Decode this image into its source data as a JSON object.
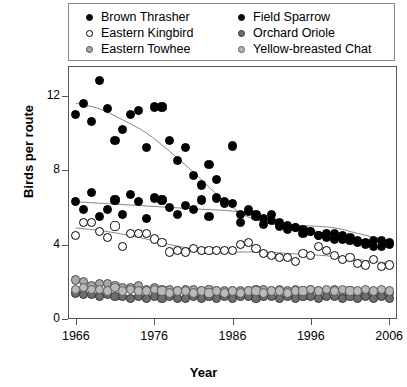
{
  "chart_data": {
    "type": "scatter",
    "title": "",
    "xlabel": "Year",
    "ylabel": "Birds per route",
    "xlim": [
      1965,
      2007
    ],
    "ylim": [
      0,
      13.6
    ],
    "xticks": [
      1966,
      1976,
      1986,
      1996,
      2006
    ],
    "yticks": [
      0,
      4,
      8,
      12
    ],
    "grid": false,
    "legend_position": "top",
    "smoothers": true,
    "series": [
      {
        "name": "Brown Thrasher",
        "marker": "filled-circle",
        "color": "#000000",
        "fill": "#000000",
        "x": [
          1966,
          1967,
          1968,
          1969,
          1970,
          1971,
          1972,
          1973,
          1974,
          1975,
          1976,
          1977,
          1978,
          1979,
          1980,
          1981,
          1982,
          1983,
          1984,
          1985,
          1986,
          1987,
          1988,
          1989,
          1990,
          1991,
          1992,
          1993,
          1994,
          1995,
          1996,
          1997,
          1998,
          1999,
          2000,
          2001,
          2002,
          2003,
          2004,
          2005,
          2006
        ],
        "y": [
          11.0,
          11.6,
          10.6,
          12.8,
          11.3,
          9.6,
          10.2,
          11.0,
          11.2,
          9.2,
          11.4,
          11.4,
          9.6,
          8.5,
          9.2,
          7.7,
          7.2,
          8.3,
          7.5,
          6.2,
          9.3,
          5.6,
          5.8,
          5.5,
          5.1,
          5.3,
          5.0,
          4.8,
          4.9,
          4.6,
          4.7,
          4.5,
          4.6,
          4.3,
          4.5,
          4.4,
          4.2,
          4.1,
          3.9,
          4.2,
          4.1
        ]
      },
      {
        "name": "Field Sparrow",
        "marker": "filled-circle",
        "color": "#000000",
        "fill": "#000000",
        "x": [
          1966,
          1967,
          1968,
          1969,
          1970,
          1971,
          1972,
          1973,
          1974,
          1975,
          1976,
          1977,
          1978,
          1979,
          1980,
          1981,
          1982,
          1983,
          1984,
          1985,
          1986,
          1987,
          1988,
          1989,
          1990,
          1991,
          1992,
          1993,
          1994,
          1995,
          1996,
          1997,
          1998,
          1999,
          2000,
          2001,
          2002,
          2003,
          2004,
          2005,
          2006
        ],
        "y": [
          6.3,
          5.9,
          6.8,
          5.5,
          5.9,
          6.4,
          5.6,
          6.7,
          6.3,
          5.4,
          6.5,
          6.4,
          6.0,
          5.6,
          6.1,
          5.9,
          6.4,
          5.5,
          6.5,
          6.3,
          6.2,
          5.2,
          5.9,
          5.6,
          5.4,
          5.6,
          5.2,
          5.0,
          4.9,
          4.8,
          4.7,
          4.5,
          4.4,
          4.6,
          4.3,
          4.2,
          4.1,
          4.0,
          4.2,
          3.9,
          4.0
        ]
      },
      {
        "name": "Eastern Kingbird",
        "marker": "open-circle",
        "color": "#000000",
        "fill": "#ffffff",
        "x": [
          1966,
          1967,
          1968,
          1969,
          1970,
          1971,
          1972,
          1973,
          1974,
          1975,
          1976,
          1977,
          1978,
          1979,
          1980,
          1981,
          1982,
          1983,
          1984,
          1985,
          1986,
          1987,
          1988,
          1989,
          1990,
          1991,
          1992,
          1993,
          1994,
          1995,
          1996,
          1997,
          1998,
          1999,
          2000,
          2001,
          2002,
          2003,
          2004,
          2005,
          2006
        ],
        "y": [
          4.5,
          5.2,
          5.2,
          4.7,
          4.4,
          5.0,
          3.9,
          4.6,
          4.6,
          4.6,
          4.3,
          4.1,
          3.6,
          3.7,
          3.6,
          3.8,
          3.7,
          3.7,
          3.7,
          3.7,
          3.7,
          4.0,
          4.1,
          3.8,
          3.5,
          3.4,
          3.3,
          3.3,
          3.1,
          3.5,
          3.4,
          3.9,
          3.7,
          3.4,
          3.2,
          3.3,
          3.0,
          2.9,
          3.2,
          2.8,
          2.9
        ]
      },
      {
        "name": "Eastern Towhee",
        "marker": "filled-circle-light",
        "color": "#4d4d4d",
        "fill": "#a8a8a8",
        "x": [
          1966,
          1967,
          1968,
          1969,
          1970,
          1971,
          1972,
          1973,
          1974,
          1975,
          1976,
          1977,
          1978,
          1979,
          1980,
          1981,
          1982,
          1983,
          1984,
          1985,
          1986,
          1987,
          1988,
          1989,
          1990,
          1991,
          1992,
          1993,
          1994,
          1995,
          1996,
          1997,
          1998,
          1999,
          2000,
          2001,
          2002,
          2003,
          2004,
          2005,
          2006
        ],
        "y": [
          2.1,
          2.0,
          1.8,
          1.9,
          1.9,
          1.8,
          1.7,
          1.7,
          1.8,
          1.6,
          1.7,
          1.6,
          1.6,
          1.5,
          1.6,
          1.6,
          1.5,
          1.6,
          1.5,
          1.5,
          1.5,
          1.5,
          1.5,
          1.6,
          1.6,
          1.5,
          1.6,
          1.5,
          1.6,
          1.5,
          1.6,
          1.5,
          1.5,
          1.6,
          1.5,
          1.5,
          1.4,
          1.5,
          1.4,
          1.5,
          1.4
        ]
      },
      {
        "name": "Orchard Oriole",
        "marker": "filled-circle-dark",
        "color": "#333333",
        "fill": "#6e6e6e",
        "x": [
          1966,
          1967,
          1968,
          1969,
          1970,
          1971,
          1972,
          1973,
          1974,
          1975,
          1976,
          1977,
          1978,
          1979,
          1980,
          1981,
          1982,
          1983,
          1984,
          1985,
          1986,
          1987,
          1988,
          1989,
          1990,
          1991,
          1992,
          1993,
          1994,
          1995,
          1996,
          1997,
          1998,
          1999,
          2000,
          2001,
          2002,
          2003,
          2004,
          2005,
          2006
        ],
        "y": [
          1.4,
          1.3,
          1.3,
          1.2,
          1.3,
          1.2,
          1.2,
          1.1,
          1.2,
          1.1,
          1.2,
          1.1,
          1.2,
          1.1,
          1.1,
          1.2,
          1.1,
          1.2,
          1.1,
          1.2,
          1.1,
          1.2,
          1.2,
          1.1,
          1.2,
          1.2,
          1.1,
          1.2,
          1.1,
          1.2,
          1.2,
          1.1,
          1.2,
          1.2,
          1.1,
          1.2,
          1.1,
          1.2,
          1.1,
          1.2,
          1.1
        ]
      },
      {
        "name": "Yellow-breasted Chat",
        "marker": "filled-circle-lighter",
        "color": "#5a5a5a",
        "fill": "#b9b9b9",
        "x": [
          1966,
          1967,
          1968,
          1969,
          1970,
          1971,
          1972,
          1973,
          1974,
          1975,
          1976,
          1977,
          1978,
          1979,
          1980,
          1981,
          1982,
          1983,
          1984,
          1985,
          1986,
          1987,
          1988,
          1989,
          1990,
          1991,
          1992,
          1993,
          1994,
          1995,
          1996,
          1997,
          1998,
          1999,
          2000,
          2001,
          2002,
          2003,
          2004,
          2005,
          2006
        ],
        "y": [
          1.6,
          1.7,
          1.6,
          1.6,
          1.5,
          1.7,
          1.5,
          1.6,
          1.5,
          1.5,
          1.6,
          1.5,
          1.4,
          1.5,
          1.5,
          1.4,
          1.5,
          1.4,
          1.5,
          1.4,
          1.5,
          1.4,
          1.5,
          1.5,
          1.4,
          1.5,
          1.5,
          1.4,
          1.5,
          1.5,
          1.6,
          1.5,
          1.6,
          1.5,
          1.6,
          1.5,
          1.5,
          1.6,
          1.5,
          1.6,
          1.5
        ]
      }
    ],
    "trend_lines": [
      {
        "series": "Brown Thrasher",
        "points": [
          [
            1966,
            11.6
          ],
          [
            1969,
            11.3
          ],
          [
            1972,
            10.7
          ],
          [
            1975,
            10.0
          ],
          [
            1978,
            9.0
          ],
          [
            1981,
            7.9
          ],
          [
            1984,
            6.7
          ],
          [
            1987,
            5.7
          ],
          [
            1990,
            5.2
          ],
          [
            1993,
            5.0
          ],
          [
            1996,
            5.0
          ],
          [
            1999,
            4.9
          ],
          [
            2002,
            4.6
          ],
          [
            2006,
            4.2
          ]
        ]
      },
      {
        "series": "Field Sparrow",
        "points": [
          [
            1966,
            6.3
          ],
          [
            1970,
            6.2
          ],
          [
            1974,
            6.1
          ],
          [
            1978,
            6.0
          ],
          [
            1982,
            5.9
          ],
          [
            1986,
            5.8
          ],
          [
            1990,
            5.5
          ],
          [
            1994,
            5.0
          ],
          [
            1998,
            4.6
          ],
          [
            2002,
            4.3
          ],
          [
            2006,
            4.0
          ]
        ]
      },
      {
        "series": "Eastern Kingbird",
        "points": [
          [
            1966,
            4.9
          ],
          [
            1970,
            4.7
          ],
          [
            1974,
            4.4
          ],
          [
            1978,
            4.0
          ],
          [
            1982,
            3.7
          ],
          [
            1986,
            3.6
          ],
          [
            1990,
            3.6
          ],
          [
            1994,
            3.5
          ],
          [
            1998,
            3.4
          ],
          [
            2002,
            3.2
          ],
          [
            2006,
            3.0
          ]
        ]
      },
      {
        "series": "Eastern Towhee",
        "points": [
          [
            1966,
            2.0
          ],
          [
            1972,
            1.75
          ],
          [
            1978,
            1.6
          ],
          [
            1984,
            1.55
          ],
          [
            1990,
            1.55
          ],
          [
            1996,
            1.55
          ],
          [
            2002,
            1.5
          ],
          [
            2006,
            1.45
          ]
        ]
      },
      {
        "series": "Orchard Oriole",
        "points": [
          [
            1966,
            1.3
          ],
          [
            1974,
            1.2
          ],
          [
            1984,
            1.15
          ],
          [
            1994,
            1.15
          ],
          [
            2006,
            1.15
          ]
        ]
      },
      {
        "series": "Yellow-breasted Chat",
        "points": [
          [
            1966,
            1.6
          ],
          [
            1974,
            1.55
          ],
          [
            1984,
            1.45
          ],
          [
            1994,
            1.5
          ],
          [
            2006,
            1.5
          ]
        ]
      }
    ]
  },
  "axis": {
    "ylabel": "Birds per route",
    "xlabel": "Year",
    "ytick_labels": [
      "0",
      "4",
      "8",
      "12"
    ],
    "xtick_labels": [
      "1966",
      "1976",
      "1986",
      "1996",
      "2006"
    ]
  },
  "legend": {
    "columns": [
      {
        "items": [
          {
            "label": "Brown Thrasher",
            "marker": "filled-circle",
            "fill": "#000000",
            "stroke": "#000000"
          },
          {
            "label": "Eastern Kingbird",
            "marker": "open-circle",
            "fill": "#ffffff",
            "stroke": "#000000"
          },
          {
            "label": "Eastern Towhee",
            "marker": "filled-circle-light",
            "fill": "#a8a8a8",
            "stroke": "#4d4d4d"
          }
        ]
      },
      {
        "items": [
          {
            "label": "Field Sparrow",
            "marker": "filled-circle",
            "fill": "#000000",
            "stroke": "#000000"
          },
          {
            "label": "Orchard Oriole",
            "marker": "filled-circle-dark",
            "fill": "#6e6e6e",
            "stroke": "#333333"
          },
          {
            "label": "Yellow-breasted Chat",
            "marker": "filled-circle-lighter",
            "fill": "#b9b9b9",
            "stroke": "#5a5a5a"
          }
        ]
      }
    ]
  }
}
